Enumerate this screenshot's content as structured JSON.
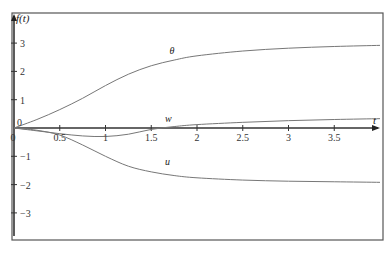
{
  "chart_data": {
    "type": "line",
    "title": "",
    "xlabel": "t",
    "ylabel": "f(t)",
    "xlim": [
      0,
      4
    ],
    "ylim": [
      -4.0,
      4.2
    ],
    "grid": false,
    "legend": "none (inline curve labels)",
    "x_ticks": [
      0,
      0.5,
      1,
      1.5,
      2,
      2.5,
      3,
      3.5
    ],
    "x_tick_labels": [
      "0",
      "0.5",
      "1",
      "1.5",
      "2",
      "2.5",
      "3",
      "3.5"
    ],
    "y_ticks": [
      3,
      2,
      1,
      0,
      -1,
      -2,
      -3
    ],
    "y_tick_labels": [
      "3",
      "2",
      "1",
      "0",
      "−1",
      "−2",
      "−3"
    ],
    "series": [
      {
        "name": "θ",
        "x": [
          0,
          0.25,
          0.5,
          0.75,
          1.0,
          1.25,
          1.5,
          1.75,
          2.0,
          2.5,
          3.0,
          3.5,
          4.0
        ],
        "y": [
          0,
          0.3,
          0.65,
          1.05,
          1.5,
          1.9,
          2.2,
          2.4,
          2.55,
          2.72,
          2.82,
          2.88,
          2.92
        ]
      },
      {
        "name": "w",
        "x": [
          0,
          0.25,
          0.5,
          0.75,
          1.0,
          1.25,
          1.5,
          1.75,
          2.0,
          2.5,
          3.0,
          3.5,
          4.0
        ],
        "y": [
          0,
          -0.1,
          -0.2,
          -0.28,
          -0.3,
          -0.22,
          -0.05,
          0.05,
          0.12,
          0.2,
          0.26,
          0.3,
          0.33
        ]
      },
      {
        "name": "u",
        "x": [
          0,
          0.25,
          0.5,
          0.75,
          1.0,
          1.25,
          1.5,
          1.75,
          2.0,
          2.5,
          3.0,
          3.5,
          4.0
        ],
        "y": [
          0,
          -0.08,
          -0.25,
          -0.6,
          -1.0,
          -1.35,
          -1.55,
          -1.68,
          -1.76,
          -1.84,
          -1.88,
          -1.9,
          -1.92
        ]
      }
    ],
    "annotations": [
      {
        "text": "θ",
        "x": 1.7,
        "y": 2.6
      },
      {
        "text": "w",
        "x": 1.65,
        "y": 0.2
      },
      {
        "text": "u",
        "x": 1.65,
        "y": -1.3
      }
    ]
  }
}
